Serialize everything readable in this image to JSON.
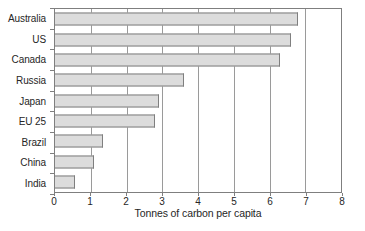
{
  "chart_data": {
    "type": "bar",
    "orientation": "horizontal",
    "title": "",
    "xlabel": "Tonnes of carbon per capita",
    "ylabel": "",
    "categories": [
      "Australia",
      "US",
      "Canada",
      "Russia",
      "Japan",
      "EU 25",
      "Brazil",
      "China",
      "India"
    ],
    "values": [
      6.8,
      6.6,
      6.3,
      3.6,
      2.9,
      2.8,
      1.35,
      1.1,
      0.55
    ],
    "xlim": [
      0,
      8
    ],
    "xticks": [
      0,
      1,
      2,
      3,
      4,
      5,
      6,
      7,
      8
    ],
    "grid": true,
    "legend": false,
    "colors": {
      "bar_fill": "#dcdcdc",
      "bar_border": "#7f7f7f",
      "axis": "#7f7f7f",
      "gridline": "#9a9a9a",
      "text": "#262626",
      "background": "#ffffff"
    }
  }
}
